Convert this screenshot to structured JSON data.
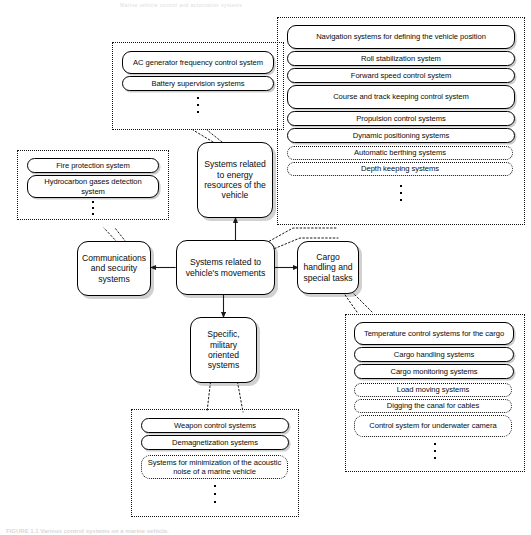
{
  "figure": {
    "page_header": "Marine vehicle control and automation systems",
    "caption": "FIGURE 1.1  Various control systems on a marine vehicle.",
    "colors": {
      "stroke": "#000000",
      "background": "#ffffff",
      "shadow": "rgba(0,0,0,0.20)",
      "dotted_border": "#111111"
    }
  },
  "nodes": {
    "energy": {
      "label": "Systems related to energy resources of the vehicle",
      "lines": [
        "Systems",
        "related to",
        "energy",
        "resources of",
        "the vehicle"
      ]
    },
    "movements": {
      "label": "Systems related to vehicle's movements",
      "lines": [
        "Systems",
        "related to",
        "vehicle's",
        "movements"
      ]
    },
    "communications": {
      "label": "Communications and security systems",
      "lines": [
        "Communications",
        "and security",
        "systems"
      ]
    },
    "cargo": {
      "label": "Cargo handling and special tasks",
      "lines": [
        "Cargo",
        "handling and",
        "special tasks"
      ]
    },
    "military": {
      "label": "Specific, military oriented systems",
      "lines": [
        "Specific,",
        "military",
        "oriented",
        "systems"
      ]
    }
  },
  "groups": {
    "energy_group": {
      "name": "Systems related to energy resources of the vehicle",
      "items": [
        {
          "label": "AC generator frequency control system",
          "style": "solid"
        },
        {
          "label": "Battery supervision systems",
          "style": "solid"
        }
      ],
      "ellipsis": true
    },
    "movements_group": {
      "name": "Systems related to vehicle's movements",
      "items": [
        {
          "label": "Navigation systems for defining the vehicle position",
          "style": "solid"
        },
        {
          "label": "Roll stabilization system",
          "style": "solid"
        },
        {
          "label": "Forward speed control system",
          "style": "solid"
        },
        {
          "label": "Course and track keeping control system",
          "style": "solid"
        },
        {
          "label": "Propulsion control systems",
          "style": "solid"
        },
        {
          "label": "Dynamic positioning systems",
          "style": "solid"
        },
        {
          "label": "Automatic berthing systems",
          "style": "dotted"
        },
        {
          "label": "Depth keeping systems",
          "style": "dotted"
        }
      ],
      "ellipsis": true
    },
    "communications_group": {
      "name": "Communications and security systems",
      "items": [
        {
          "label": "Fire protection system",
          "style": "solid"
        },
        {
          "label": "Hydrocarbon gases detection system",
          "style": "solid"
        }
      ],
      "ellipsis": true
    },
    "cargo_group": {
      "name": "Cargo handling and special tasks",
      "items": [
        {
          "label": "Temperature control systems for the cargo",
          "style": "solid"
        },
        {
          "label": "Cargo handling systems",
          "style": "solid"
        },
        {
          "label": "Cargo monitoring systems",
          "style": "solid"
        },
        {
          "label": "Load moving systems",
          "style": "dotted"
        },
        {
          "label": "Digging the canal for cables",
          "style": "dotted"
        },
        {
          "label": "Control system for underwater camera",
          "style": "dotted"
        }
      ],
      "ellipsis": true
    },
    "military_group": {
      "name": "Specific, military oriented systems",
      "items": [
        {
          "label": "Weapon control systems",
          "style": "solid"
        },
        {
          "label": "Demagnetization systems",
          "style": "solid"
        },
        {
          "label": "Systems for minimization of the acoustic noise of a marine vehicle",
          "style": "dotted"
        }
      ],
      "ellipsis": true
    }
  }
}
